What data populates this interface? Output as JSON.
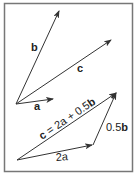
{
  "diagram": {
    "colors": {
      "frame": "#777777",
      "stroke": "#333333",
      "background": "#ffffff"
    },
    "top_panel": {
      "vectors": [
        {
          "id": "a",
          "label": "a"
        },
        {
          "id": "b",
          "label": "b"
        },
        {
          "id": "c",
          "label": "c"
        }
      ]
    },
    "bottom_panel": {
      "vectors": [
        {
          "id": "2a",
          "label_num": "2",
          "label_var": "a"
        },
        {
          "id": "0.5b",
          "label_num": "0.5",
          "label_var": "b"
        },
        {
          "id": "resultant",
          "label_prefix": "c",
          "label_eq": " = 2a + 0.5",
          "label_var": "b"
        }
      ]
    }
  }
}
